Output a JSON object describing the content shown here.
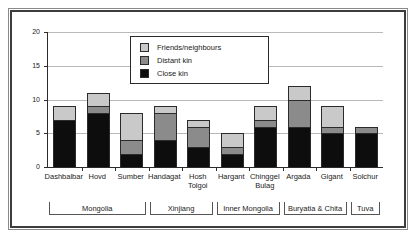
{
  "chart_data": {
    "type": "bar",
    "stacked": true,
    "title": "",
    "xlabel": "",
    "ylabel": "",
    "ylim": [
      0,
      20
    ],
    "yticks": [
      0,
      5,
      10,
      15,
      20
    ],
    "grid": true,
    "legend_position": "inside-top-center",
    "categories": [
      "Dashbalbar",
      "Hovd",
      "Sumber",
      "Handagat",
      "Hosh\nTolgoi",
      "Hargant",
      "Chinggel\nBulag",
      "Argada",
      "Gigant",
      "Solchur"
    ],
    "series": [
      {
        "name": "Close kin",
        "color": "#0d0d0d",
        "values": [
          7,
          8,
          2,
          4,
          3,
          2,
          6,
          6,
          5,
          5
        ]
      },
      {
        "name": "Distant kin",
        "color": "#8b8b8b",
        "values": [
          0,
          1,
          2,
          4,
          3,
          1,
          1,
          4,
          1,
          1
        ]
      },
      {
        "name": "Friends/neighbours",
        "color": "#c9c9c9",
        "values": [
          2,
          2,
          4,
          1,
          1,
          2,
          2,
          2,
          3,
          0
        ]
      }
    ],
    "totals": [
      9,
      11,
      8,
      9,
      7,
      5,
      9,
      12,
      9,
      6
    ],
    "groups": [
      {
        "label": "Mongolia",
        "first": 0,
        "last": 2
      },
      {
        "label": "Xinjiang",
        "first": 3,
        "last": 4
      },
      {
        "label": "Inner Mongolia",
        "first": 5,
        "last": 6
      },
      {
        "label": "Buryatia & Chita",
        "first": 7,
        "last": 8
      },
      {
        "label": "Tuva",
        "first": 9,
        "last": 9
      }
    ]
  },
  "legend": {
    "items": [
      {
        "label": "Friends/neighbours",
        "color": "#c9c9c9"
      },
      {
        "label": "Distant kin",
        "color": "#8b8b8b"
      },
      {
        "label": "Close kin",
        "color": "#0d0d0d"
      }
    ]
  },
  "axis": {
    "y_tick_labels": [
      "0",
      "5",
      "10",
      "15",
      "20"
    ]
  }
}
